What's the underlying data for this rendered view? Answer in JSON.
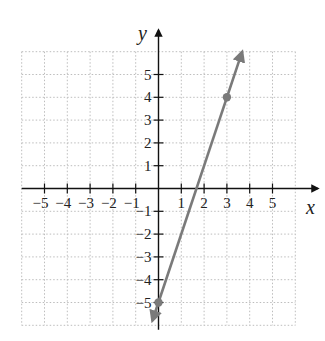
{
  "chart_data": {
    "type": "line",
    "title": "",
    "xlabel": "x",
    "ylabel": "y",
    "xlim": [
      -6,
      6
    ],
    "ylim": [
      -6,
      6
    ],
    "grid": true,
    "grid_style": "dotted",
    "x_ticks": [
      -5,
      -4,
      -3,
      -2,
      -1,
      1,
      2,
      3,
      4,
      5
    ],
    "y_ticks": [
      5,
      4,
      3,
      2,
      1,
      -1,
      -2,
      -3,
      -4,
      -5
    ],
    "x_tick_labels": [
      "−5",
      "−4",
      "−3",
      "−2",
      "−1",
      "1",
      "2",
      "3",
      "4",
      "5"
    ],
    "y_tick_labels": [
      "5",
      "4",
      "3",
      "2",
      "1",
      "−1",
      "−2",
      "−3",
      "−4",
      "−5"
    ],
    "series": [
      {
        "name": "line",
        "equation": "y = 3x - 5",
        "x": [
          -0.27,
          3.67
        ],
        "y": [
          -5.8,
          6.0
        ],
        "color": "#7a7a7a",
        "arrows": "both"
      }
    ],
    "points": [
      {
        "x": 0,
        "y": -5,
        "color": "#7a7a7a"
      },
      {
        "x": 3,
        "y": 4,
        "color": "#7a7a7a"
      }
    ],
    "legend": null
  },
  "labels": {
    "x_axis": "x",
    "y_axis": "y"
  },
  "colors": {
    "axis": "#111111",
    "grid": "#bdbdbd",
    "line": "#7a7a7a",
    "point": "#7a7a7a"
  }
}
